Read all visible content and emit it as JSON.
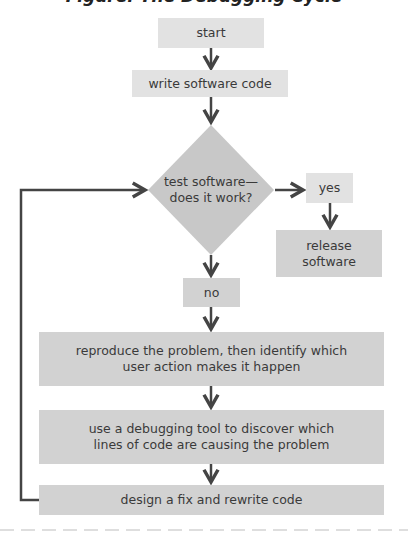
{
  "title": "Figure: The Debugging Cycle",
  "colors": {
    "arrow": "#444444",
    "box_light": "#e2e2e2",
    "box_mid": "#d2d2d2",
    "diamond": "#c8c8c8",
    "dashed_rule": "#bdbdbd"
  },
  "nodes": {
    "start": "start",
    "write": "write software code",
    "decision_line1": "test software—",
    "decision_line2": "does it work?",
    "yes": "yes",
    "release_line1": "release",
    "release_line2": "software",
    "no": "no",
    "reproduce_line1": "reproduce the problem, then identify which",
    "reproduce_line2": "user action makes it happen",
    "debug_line1": "use a debugging tool to discover which",
    "debug_line2": "lines of code are causing the problem",
    "design": "design a fix and rewrite code"
  },
  "edges": [
    {
      "from": "start",
      "to": "write"
    },
    {
      "from": "write",
      "to": "decision"
    },
    {
      "from": "decision",
      "to": "yes"
    },
    {
      "from": "yes",
      "to": "release"
    },
    {
      "from": "decision",
      "to": "no"
    },
    {
      "from": "no",
      "to": "reproduce"
    },
    {
      "from": "reproduce",
      "to": "debug"
    },
    {
      "from": "debug",
      "to": "design"
    },
    {
      "from": "design",
      "to": "decision",
      "type": "loop-back"
    }
  ]
}
